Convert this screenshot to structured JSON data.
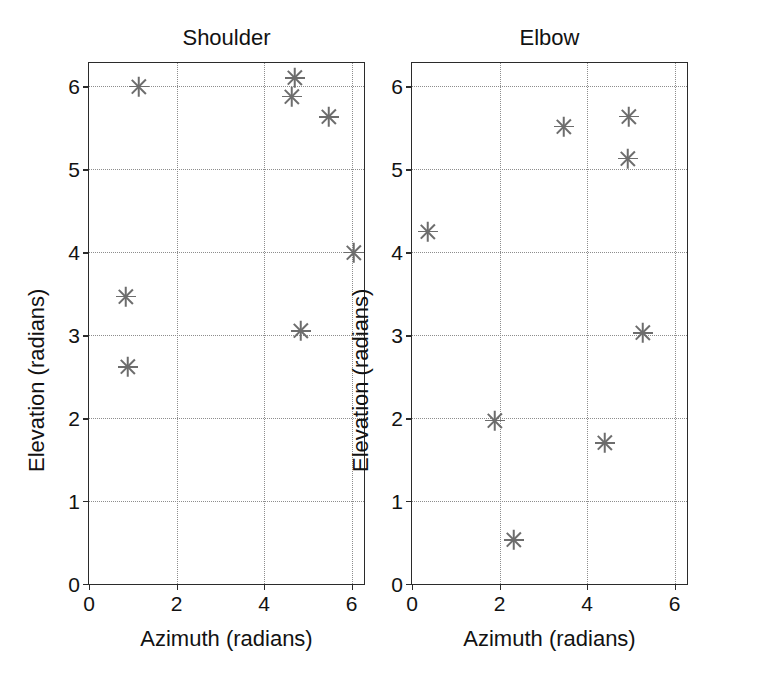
{
  "chart_data": [
    {
      "type": "scatter",
      "title": "Shoulder",
      "xlabel": "Azimuth (radians)",
      "ylabel": "Elevation (radians)",
      "xlim": [
        0,
        6.2832
      ],
      "ylim": [
        0,
        6.2832
      ],
      "xticks": [
        0,
        2,
        4,
        6
      ],
      "yticks": [
        0,
        1,
        2,
        3,
        4,
        5,
        6
      ],
      "xticklabels": [
        "0",
        "2",
        "4",
        "6"
      ],
      "yticklabels": [
        "0",
        "1",
        "2",
        "3",
        "4",
        "5",
        "6"
      ],
      "grid": true,
      "marker": "asterisk",
      "marker_color": "#6d6d6d",
      "legend": null,
      "points": [
        {
          "x": 1.15,
          "y": 6.0
        },
        {
          "x": 4.7,
          "y": 6.1
        },
        {
          "x": 4.63,
          "y": 5.88
        },
        {
          "x": 5.48,
          "y": 5.63
        },
        {
          "x": 6.05,
          "y": 4.0
        },
        {
          "x": 0.85,
          "y": 3.47
        },
        {
          "x": 4.85,
          "y": 3.05
        },
        {
          "x": 0.88,
          "y": 2.62
        }
      ]
    },
    {
      "type": "scatter",
      "title": "Elbow",
      "xlabel": "Azimuth (radians)",
      "ylabel": "Elevation (radians)",
      "xlim": [
        0,
        6.2832
      ],
      "ylim": [
        0,
        6.2832
      ],
      "xticks": [
        0,
        2,
        4,
        6
      ],
      "yticks": [
        0,
        1,
        2,
        3,
        4,
        5,
        6
      ],
      "xticklabels": [
        "0",
        "2",
        "4",
        "6"
      ],
      "yticklabels": [
        "0",
        "1",
        "2",
        "3",
        "4",
        "5",
        "6"
      ],
      "grid": true,
      "marker": "asterisk",
      "marker_color": "#6d6d6d",
      "legend": null,
      "points": [
        {
          "x": 4.95,
          "y": 5.64
        },
        {
          "x": 3.47,
          "y": 5.52
        },
        {
          "x": 4.93,
          "y": 5.13
        },
        {
          "x": 0.36,
          "y": 4.25
        },
        {
          "x": 5.28,
          "y": 3.03
        },
        {
          "x": 1.9,
          "y": 1.97
        },
        {
          "x": 4.4,
          "y": 1.7
        },
        {
          "x": 2.33,
          "y": 0.53
        }
      ]
    }
  ],
  "figure": {
    "background": "#ffffff",
    "axis_color": "#2b2b2b",
    "grid_color": "#8d8d8d",
    "marker_color": "#6d6d6d"
  }
}
